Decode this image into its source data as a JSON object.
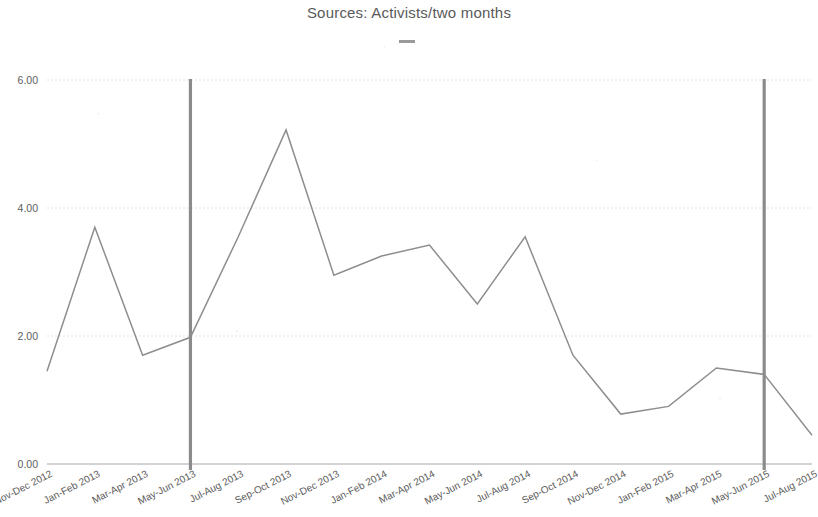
{
  "chart_data": {
    "type": "line",
    "title": "Sources: Activists/two months",
    "xlabel": "",
    "ylabel": "",
    "ylim": [
      0,
      6
    ],
    "yticks": [
      "0.00",
      "2.00",
      "4.00",
      "6.00"
    ],
    "ytick_values": [
      0,
      2,
      4,
      6
    ],
    "grid": true,
    "legend_position": "top-center",
    "legend_entries": [
      {
        "name": "",
        "marker": "line-dash",
        "color": "#9a9a9a"
      }
    ],
    "categories": [
      "Nov-Dec 2012",
      "Jan-Feb 2013",
      "Mar-Apr 2013",
      "May-Jun 2013",
      "Jul-Aug 2013",
      "Sep-Oct 2013",
      "Nov-Dec 2013",
      "Jan-Feb 2014",
      "Mar-Apr 2014",
      "May-Jun 2014",
      "Jul-Aug 2014",
      "Sep-Oct 2014",
      "Nov-Dec 2014",
      "Jan-Feb 2015",
      "Mar-Apr 2015",
      "May-Jun 2015",
      "Jul-Aug 2015"
    ],
    "series": [
      {
        "name": "Activists",
        "color": "#8e8e8e",
        "values": [
          1.45,
          3.7,
          1.7,
          1.98,
          3.55,
          5.22,
          2.95,
          3.25,
          3.42,
          2.5,
          3.55,
          1.7,
          0.78,
          0.9,
          1.5,
          1.4,
          0.45
        ]
      }
    ],
    "annotations": [
      {
        "type": "vertical-line",
        "at_category": "May-Jun 2013",
        "color": "#8b8b8b"
      },
      {
        "type": "vertical-line",
        "at_category": "May-Jun 2015",
        "color": "#8b8b8b"
      }
    ]
  }
}
